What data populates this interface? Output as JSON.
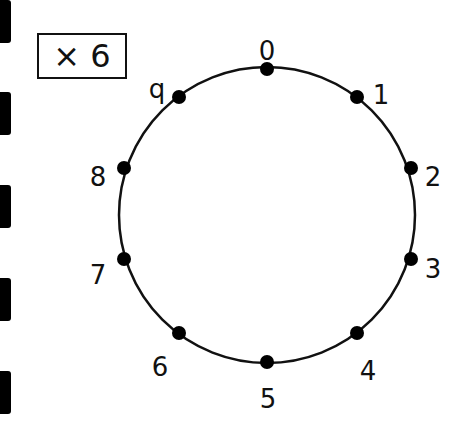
{
  "multiplier_box": {
    "label": "× 6"
  },
  "binder_holes": [
    {
      "top": 0
    },
    {
      "top": 92
    },
    {
      "top": 185
    },
    {
      "top": 278
    },
    {
      "top": 371
    }
  ],
  "circle": {
    "center": [
      267,
      215
    ],
    "radius": 148,
    "stroke": "#111111",
    "points": [
      {
        "label": "0",
        "x": 267,
        "y": 69,
        "lx": 267,
        "ly": 52
      },
      {
        "label": "1",
        "x": 357,
        "y": 97,
        "lx": 381,
        "ly": 96
      },
      {
        "label": "2",
        "x": 411,
        "y": 168,
        "lx": 433,
        "ly": 178
      },
      {
        "label": "3",
        "x": 411,
        "y": 259,
        "lx": 433,
        "ly": 270
      },
      {
        "label": "4",
        "x": 357,
        "y": 333,
        "lx": 368,
        "ly": 372
      },
      {
        "label": "5",
        "x": 267,
        "y": 362,
        "lx": 268,
        "ly": 400
      },
      {
        "label": "6",
        "x": 179,
        "y": 333,
        "lx": 160,
        "ly": 368
      },
      {
        "label": "7",
        "x": 124,
        "y": 259,
        "lx": 98,
        "ly": 276
      },
      {
        "label": "8",
        "x": 124,
        "y": 168,
        "lx": 98,
        "ly": 178
      },
      {
        "label": "q",
        "x": 179,
        "y": 97,
        "lx": 157,
        "ly": 90
      }
    ]
  }
}
